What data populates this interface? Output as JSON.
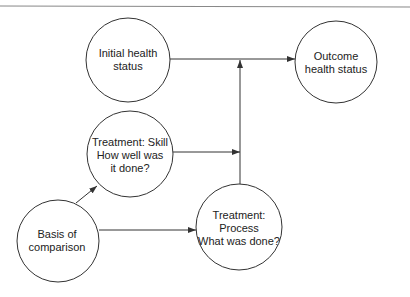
{
  "diagram": {
    "type": "flow",
    "colors": {
      "stroke": "#333333",
      "rule": "#888888",
      "text": "#222222",
      "background": "#ffffff"
    },
    "nodes": [
      {
        "id": "initial",
        "label_lines": [
          "Initial health",
          "status"
        ],
        "cx": 128,
        "cy": 60,
        "r": 42
      },
      {
        "id": "outcome",
        "label_lines": [
          "Outcome",
          "health status"
        ],
        "cx": 336,
        "cy": 62,
        "r": 41
      },
      {
        "id": "skill",
        "label_lines": [
          "Treatment: Skill",
          "How well was",
          "it done?"
        ],
        "cx": 130,
        "cy": 154,
        "r": 43
      },
      {
        "id": "basis",
        "label_lines": [
          "Basis of",
          "comparison"
        ],
        "cx": 58,
        "cy": 241,
        "r": 41
      },
      {
        "id": "process",
        "label_lines": [
          "Treatment:",
          "Process",
          "What was done?"
        ],
        "cx": 239,
        "cy": 227,
        "r": 43
      }
    ],
    "edges": [
      {
        "from": "initial",
        "to": "outcome",
        "label": ""
      },
      {
        "from": "process",
        "to": "initial-outcome-edge",
        "label": ""
      },
      {
        "from": "skill",
        "to": "process-vertical-edge",
        "label": ""
      },
      {
        "from": "basis",
        "to": "skill",
        "label": ""
      },
      {
        "from": "basis",
        "to": "process",
        "label": ""
      }
    ]
  },
  "labels": {
    "initial_1": "Initial health",
    "initial_2": "status",
    "outcome_1": "Outcome",
    "outcome_2": "health status",
    "skill_1": "Treatment: Skill",
    "skill_2": "How well was",
    "skill_3": "it done?",
    "basis_1": "Basis of",
    "basis_2": "comparison",
    "process_1": "Treatment:",
    "process_2": "Process",
    "process_3": "What was done?"
  }
}
